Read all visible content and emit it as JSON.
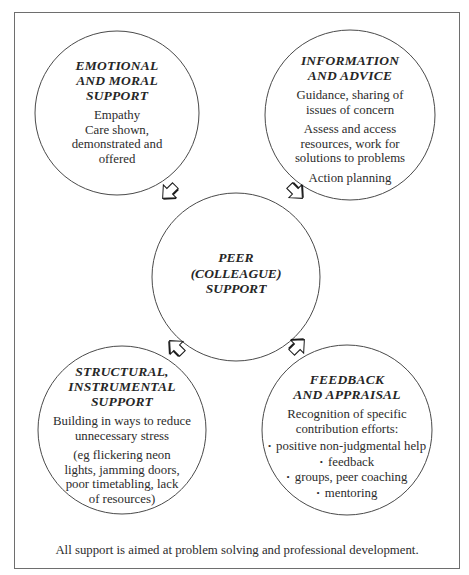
{
  "header": {
    "clipped_text": "FIGURE"
  },
  "center": {
    "title_lines": [
      "PEER",
      "(COLLEAGUE)",
      "SUPPORT"
    ]
  },
  "circles": [
    {
      "id": "emotional",
      "title_lines": [
        "EMOTIONAL",
        "AND MORAL",
        "SUPPORT"
      ],
      "body_groups": [
        [
          "Empathy",
          "Care shown,",
          "demonstrated and",
          "offered"
        ]
      ]
    },
    {
      "id": "information",
      "title_lines": [
        "INFORMATION",
        "AND ADVICE"
      ],
      "body_groups": [
        [
          "Guidance, sharing of",
          "issues of concern"
        ],
        [
          "Assess and access",
          "resources, work for",
          "solutions to problems"
        ],
        [
          "Action planning"
        ]
      ]
    },
    {
      "id": "structural",
      "title_lines": [
        "STRUCTURAL,",
        "INSTRUMENTAL",
        "SUPPORT"
      ],
      "body_groups": [
        [
          "Building in ways to reduce",
          "unnecessary stress"
        ],
        [
          "(eg flickering neon",
          "lights, jamming doors,",
          "poor timetabling, lack",
          "of resources)"
        ]
      ]
    },
    {
      "id": "feedback",
      "title_lines": [
        "FEEDBACK",
        "AND APPRAISAL"
      ],
      "body_groups": [
        [
          "Recognition of specific",
          "contribution efforts:"
        ]
      ],
      "bullets": [
        "positive non-judgmental help",
        "feedback",
        "groups, peer coaching",
        "mentoring"
      ]
    }
  ],
  "footer": {
    "text": "All support is aimed at problem solving and professional development."
  },
  "colors": {
    "line": "#4a4a4a",
    "frame": "#6e6e6e",
    "text": "#2a2a2a",
    "arrow_shadow": "#1a1a1a"
  }
}
